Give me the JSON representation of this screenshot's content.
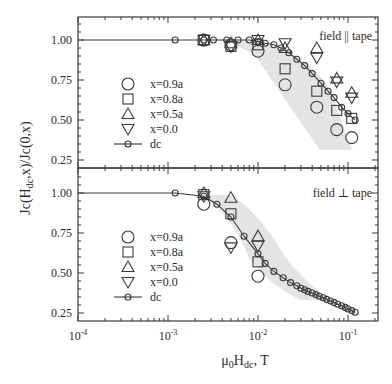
{
  "chart_data": [
    {
      "type": "scatter",
      "panel": "top",
      "annotation": "field || tape",
      "xscale": "log",
      "xlim": [
        0.0001,
        0.2
      ],
      "ylim": [
        0.2,
        1.15
      ],
      "yticks": [
        0.25,
        0.5,
        0.75,
        1.0
      ],
      "ytick_labels": [
        "0.25",
        "0.50",
        "0.75",
        "1.00"
      ],
      "legend": [
        "x=0.9a",
        "x=0.8a",
        "x=0.5a",
        "x=0.0",
        "dc"
      ],
      "series": [
        {
          "name": "x=0.9a",
          "marker": "circle",
          "x": [
            0.0025,
            0.005,
            0.01,
            0.02,
            0.045,
            0.075,
            0.11
          ],
          "y": [
            1.0,
            0.97,
            0.93,
            0.72,
            0.58,
            0.44,
            0.39
          ]
        },
        {
          "name": "x=0.8a",
          "marker": "square",
          "x": [
            0.0025,
            0.005,
            0.01,
            0.02,
            0.045,
            0.075,
            0.11
          ],
          "y": [
            1.0,
            0.96,
            0.97,
            0.82,
            0.68,
            0.56,
            0.51
          ]
        },
        {
          "name": "x=0.5a",
          "marker": "triangle-up",
          "x": [
            0.0025,
            0.005,
            0.01,
            0.02,
            0.045,
            0.075,
            0.11
          ],
          "y": [
            1.0,
            0.98,
            1.0,
            0.95,
            0.95,
            0.76,
            0.67
          ]
        },
        {
          "name": "x=0.0",
          "marker": "triangle-down",
          "x": [
            0.0025,
            0.005,
            0.01,
            0.02,
            0.045,
            0.075,
            0.11
          ],
          "y": [
            1.0,
            0.96,
            1.0,
            0.98,
            0.89,
            0.74,
            0.64
          ]
        },
        {
          "name": "dc",
          "marker": "circle-line",
          "x": [
            0.0012,
            0.0025,
            0.0032,
            0.0045,
            0.006,
            0.008,
            0.01,
            0.012,
            0.015,
            0.018,
            0.022,
            0.027,
            0.033,
            0.04,
            0.05,
            0.06,
            0.07,
            0.085,
            0.1,
            0.12
          ],
          "y": [
            1.0,
            1.0,
            1.0,
            1.0,
            1.0,
            1.0,
            0.99,
            0.98,
            0.97,
            0.95,
            0.92,
            0.88,
            0.84,
            0.79,
            0.73,
            0.68,
            0.64,
            0.58,
            0.54,
            0.5
          ]
        }
      ]
    },
    {
      "type": "scatter",
      "panel": "bottom",
      "annotation": "field ⊥ tape",
      "xscale": "log",
      "xlim": [
        0.0001,
        0.2
      ],
      "ylim": [
        0.2,
        1.15
      ],
      "yticks": [
        0.25,
        0.5,
        0.75,
        1.0
      ],
      "ytick_labels": [
        "0.25",
        "0.50",
        "0.75",
        "1.00"
      ],
      "legend": [
        "x=0.9a",
        "x=0.8a",
        "x=0.5a",
        "x=0.0",
        "dc"
      ],
      "series": [
        {
          "name": "x=0.9a",
          "marker": "circle",
          "x": [
            0.0025,
            0.005,
            0.01
          ],
          "y": [
            0.93,
            0.69,
            0.48
          ]
        },
        {
          "name": "x=0.8a",
          "marker": "square",
          "x": [
            0.0025,
            0.005,
            0.01
          ],
          "y": [
            0.99,
            0.87,
            0.57
          ]
        },
        {
          "name": "x=0.5a",
          "marker": "triangle-up",
          "x": [
            0.0025,
            0.005,
            0.01
          ],
          "y": [
            1.0,
            0.97,
            0.73
          ]
        },
        {
          "name": "x=0.0",
          "marker": "triangle-down",
          "x": [
            0.0025,
            0.005,
            0.01
          ],
          "y": [
            0.98,
            0.66,
            0.67
          ]
        },
        {
          "name": "dc",
          "marker": "circle-line",
          "x": [
            0.0012,
            0.0025,
            0.0035,
            0.005,
            0.007,
            0.01,
            0.012,
            0.015,
            0.019,
            0.023,
            0.027,
            0.03,
            0.033,
            0.036,
            0.04,
            0.044,
            0.048,
            0.053,
            0.058,
            0.064,
            0.07,
            0.077,
            0.085,
            0.093,
            0.1,
            0.11,
            0.12
          ],
          "y": [
            1.0,
            0.98,
            0.93,
            0.85,
            0.73,
            0.62,
            0.56,
            0.51,
            0.47,
            0.44,
            0.42,
            0.405,
            0.395,
            0.385,
            0.375,
            0.365,
            0.355,
            0.345,
            0.335,
            0.325,
            0.315,
            0.305,
            0.295,
            0.285,
            0.275,
            0.265,
            0.255
          ]
        }
      ]
    }
  ],
  "axes": {
    "ylabel": "Jc(H",
    "ylabel_sub": "dc",
    "ylabel_rest": ",x)/Jc(0,x)",
    "xlabel_mu": "μ",
    "xlabel_mu_sub": "0",
    "xlabel_H": "H",
    "xlabel_H_sub": "dc",
    "xlabel_rest": ", T",
    "xtick_labels": [
      {
        "base": "10",
        "exp": "-4"
      },
      {
        "base": "10",
        "exp": "-3"
      },
      {
        "base": "10",
        "exp": "-2"
      },
      {
        "base": "10",
        "exp": "-1"
      }
    ]
  },
  "colors": {
    "ink": "#3a3a3a",
    "band": "#d8d8d8",
    "background": "#ffffff"
  }
}
